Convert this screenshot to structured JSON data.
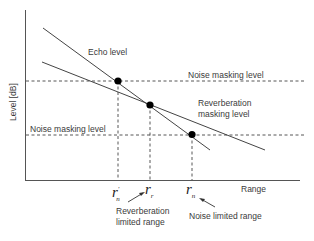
{
  "diagram": {
    "y_axis_label": "Level [dB]",
    "x_axis_label": "Range",
    "lines": {
      "echo_level": "Echo level",
      "noise_masking_upper": "Noise masking level",
      "noise_masking_lower": "Noise masking level",
      "reverb_masking_1": "Reverberation",
      "reverb_masking_2": "masking level"
    },
    "ticks": {
      "r_n_prime": {
        "main": "r",
        "sub": "n",
        "sup": "'"
      },
      "r_r": {
        "main": "r",
        "sub": "r"
      },
      "r_n": {
        "main": "r",
        "sub": "n"
      }
    },
    "annotations": {
      "reverb_limited_1": "Reverberation",
      "reverb_limited_2": "limited range",
      "noise_limited": "Noise limited range"
    },
    "colors": {
      "line": "#444444",
      "dot": "#000000",
      "text": "#3a3a3a"
    }
  }
}
